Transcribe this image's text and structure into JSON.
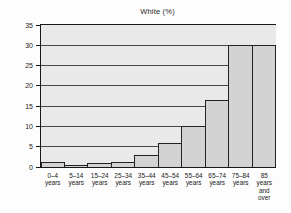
{
  "figure": {
    "title": "White (%)"
  },
  "chart_data": {
    "type": "bar",
    "title": "White (%)",
    "categories": [
      "0–4\nyears",
      "5–14\nyears",
      "15–24\nyears",
      "25–34\nyears",
      "35–44\nyears",
      "45–54\nyears",
      "55–64\nyears",
      "65–74\nyears",
      "75–84\nyears",
      "85\nyears\nand\nover"
    ],
    "values": [
      1.2,
      0.4,
      1,
      1.3,
      3,
      6,
      10,
      16.5,
      30,
      30
    ],
    "xlabel": "",
    "ylabel": "",
    "ylim": [
      0,
      35
    ],
    "yticks": [
      0,
      5,
      10,
      15,
      20,
      25,
      30,
      35
    ],
    "grid": "horizontal",
    "legend": "none",
    "colors": {
      "plot_background": "#e9e9e9",
      "bar_fill": "#d3d3d3",
      "bar_border": "#222222",
      "gridline": "#484848",
      "axis": "#181818",
      "text": "#1a1a1a",
      "page_background": "#fdfdfd"
    }
  }
}
